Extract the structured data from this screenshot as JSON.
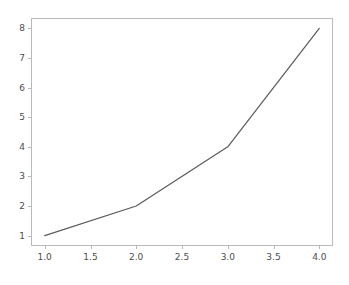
{
  "chart_data": {
    "type": "line",
    "title": "",
    "xlabel": "",
    "ylabel": "",
    "x": [
      1,
      2,
      3,
      4
    ],
    "values": [
      1,
      2,
      4,
      8
    ],
    "series": [
      {
        "name": "",
        "x": [
          1,
          2,
          3,
          4
        ],
        "values": [
          1,
          2,
          4,
          8
        ]
      }
    ],
    "xlim": [
      0.85,
      4.15
    ],
    "ylim": [
      0.65,
      8.35
    ],
    "xticks": [
      1.0,
      1.5,
      2.0,
      2.5,
      3.0,
      3.5,
      4.0
    ],
    "xtick_labels": [
      "1.0",
      "1.5",
      "2.0",
      "2.5",
      "3.0",
      "3.5",
      "4.0"
    ],
    "yticks": [
      1,
      2,
      3,
      4,
      5,
      6,
      7,
      8
    ],
    "ytick_labels": [
      "1",
      "2",
      "3",
      "4",
      "5",
      "6",
      "7",
      "8"
    ],
    "grid": false,
    "legend": null,
    "legend_position": "none",
    "annotations": [],
    "line_color": "#5a5a5a",
    "line_width": 1.2,
    "marker": "none",
    "background_color": "#ffffff",
    "axes_color": "#b9b9b9",
    "tick_label_color": "#4d4d4d"
  }
}
